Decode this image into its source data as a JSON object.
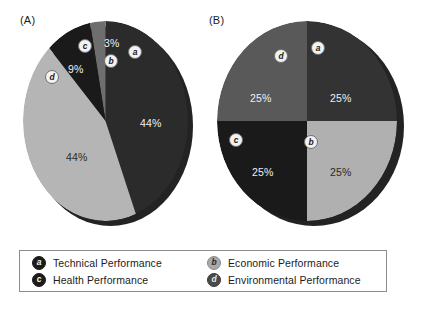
{
  "figure": {
    "panels": [
      {
        "id": "A",
        "label": "(A)"
      },
      {
        "id": "B",
        "label": "(B)"
      }
    ]
  },
  "legend": {
    "items": [
      {
        "key": "a",
        "letter": "a",
        "label": "Technical Performance",
        "marker_style": "dark-face",
        "color": "#2b2b2b"
      },
      {
        "key": "b",
        "letter": "b",
        "label": "Economic Performance",
        "marker_style": "mid-face",
        "color": "#6e6e6e"
      },
      {
        "key": "c",
        "letter": "c",
        "label": "Health Performance",
        "marker_style": "dark-face",
        "color": "#1a1a1a"
      },
      {
        "key": "d",
        "letter": "d",
        "label": "Environmental Performance",
        "marker_style": "deep-face",
        "color": "#b5b5b5"
      }
    ]
  },
  "markers": {
    "a_letter": "a",
    "b_letter": "b",
    "c_letter": "c",
    "d_letter": "d"
  },
  "chart_data": [
    {
      "type": "pie",
      "title": "(A)",
      "categories": [
        "Technical Performance",
        "Economic Performance",
        "Health Performance",
        "Environmental Performance"
      ],
      "keys": [
        "a",
        "b",
        "c",
        "d"
      ],
      "values": [
        44,
        3,
        9,
        44
      ],
      "labels": [
        "44%",
        "3%",
        "9%",
        "44%"
      ],
      "colors": [
        "#2b2b2b",
        "#6e6e6e",
        "#1a1a1a",
        "#b5b5b5"
      ],
      "legend_position": "bottom",
      "grid": false
    },
    {
      "type": "pie",
      "title": "(B)",
      "categories": [
        "Technical Performance",
        "Economic Performance",
        "Health Performance",
        "Environmental Performance"
      ],
      "keys": [
        "a",
        "b",
        "c",
        "d"
      ],
      "values": [
        25,
        25,
        25,
        25
      ],
      "labels": [
        "25%",
        "25%",
        "25%",
        "25%"
      ],
      "colors": [
        "#333333",
        "#b0b0b0",
        "#1a1a1a",
        "#595959"
      ],
      "legend_position": "bottom",
      "grid": false
    }
  ]
}
